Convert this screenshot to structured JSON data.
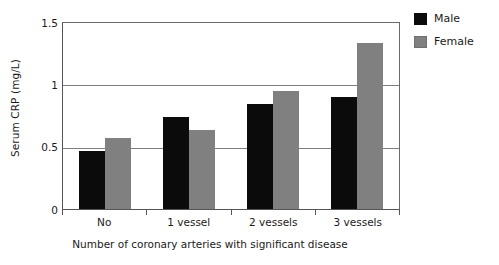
{
  "chart_data": {
    "type": "bar",
    "title": "",
    "categories": [
      "No",
      "1 vessel",
      "2 vessels",
      "3 vessels"
    ],
    "series": [
      {
        "name": "Male",
        "color": "#0b0b0b",
        "values": [
          0.47,
          0.74,
          0.85,
          0.9
        ]
      },
      {
        "name": "Female",
        "color": "#808080",
        "values": [
          0.57,
          0.64,
          0.95,
          1.34
        ]
      }
    ],
    "xlabel": "Number of coronary arteries with significant disease",
    "ylabel": "Serum CRP (mg/L)",
    "ylim": [
      0,
      1.5
    ],
    "yticks": [
      0,
      0.5,
      1,
      1.5
    ],
    "ytick_labels": [
      "0",
      "0.5",
      "1",
      "1.5"
    ],
    "grid": true,
    "grid_axis": "y",
    "legend_position": "right"
  },
  "legend": {
    "entries": [
      {
        "label": "Male",
        "color": "#0b0b0b"
      },
      {
        "label": "Female",
        "color": "#808080"
      }
    ]
  }
}
